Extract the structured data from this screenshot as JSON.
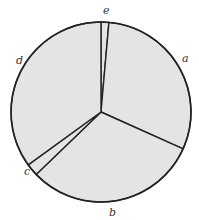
{
  "chart_data": {
    "type": "pie",
    "title": "",
    "categories": [
      "e",
      "a",
      "b",
      "c",
      "d"
    ],
    "values": [
      1.4,
      30.3,
      31.1,
      2.2,
      35.0
    ],
    "start_angle_deg": 270,
    "direction": "clockwise",
    "legend": "none",
    "labels_position": "outside",
    "fill_color": "#e4e4e4",
    "stroke_color": "#222222"
  },
  "labels": {
    "a": "a",
    "b": "b",
    "c": "c",
    "d": "d",
    "e": "e"
  }
}
